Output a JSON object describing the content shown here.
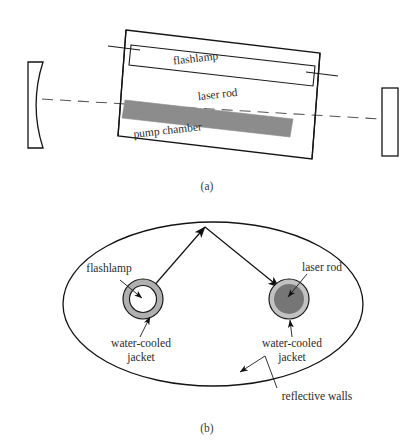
{
  "figure": {
    "background_color": "#ffffff",
    "line_color": "#1a1a1a",
    "width": 416,
    "height": 443
  },
  "panel_a": {
    "caption": "(a)",
    "labels": {
      "flashlamp": "flashlamp",
      "laser_rod": "laser rod",
      "pump_chamber": "pump chamber"
    },
    "components": {
      "rear_mirror_name": "concave rear mirror",
      "output_mirror_name": "flat output mirror",
      "optical_axis_name": "optical axis",
      "rod_fill_color": "#8c8c8c",
      "chamber_tilt_degrees": -8
    }
  },
  "panel_b": {
    "caption": "(b)",
    "labels": {
      "flashlamp": "flashlamp",
      "laser_rod": "laser rod",
      "water_cooled_jacket_left_line1": "water-cooled",
      "water_cooled_jacket_left_line2": "jacket",
      "water_cooled_jacket_right_line1": "water-cooled",
      "water_cooled_jacket_right_line2": "jacket",
      "reflective_walls": "reflective walls"
    },
    "components": {
      "cavity_shape": "ellipse",
      "flashlamp_ring_color": "#b0b0b0",
      "flashlamp_core_color": "#ffffff",
      "rod_ring_color": "#c2c2c2",
      "rod_core_color": "#767676",
      "ray_count": 2
    }
  }
}
